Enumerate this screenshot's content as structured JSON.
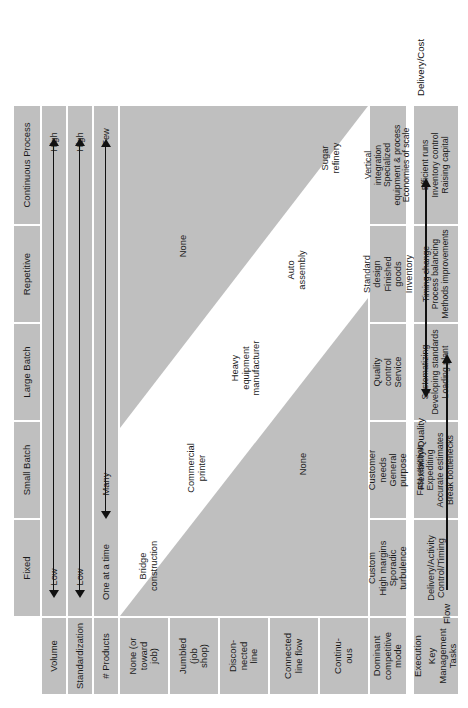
{
  "diagram": {
    "flow_axis_label": "Flow",
    "right_axis": {
      "top_label": "Delivery/Cost",
      "bottom_label": "Flexibility/Quality"
    },
    "corner_header": {
      "line1": "Execution",
      "line2": "Key",
      "line3": "Management",
      "line4": "Tasks"
    },
    "columns": [
      "Fixed",
      "Small Batch",
      "Large Batch",
      "Repetitive",
      "Continuous Process"
    ],
    "row_headers": [
      "Volume",
      "Standardization",
      "# Products"
    ],
    "scales": [
      {
        "name": "Volume",
        "low": "Low",
        "high": "High"
      },
      {
        "name": "Standardization",
        "low": "Low",
        "high": "High"
      },
      {
        "name": "# Products",
        "low": "One at a time",
        "high": "Few",
        "mid": "Many"
      }
    ],
    "process_rows": [
      "None (or\ntoward\njob)",
      "Jumbled\n(job\nshop)",
      "Discon-\nnected\nline",
      "Connected\nline flow",
      "Continu-\nous"
    ],
    "process_rows_flat": [
      "None (or toward job)",
      "Jumbled (job shop)",
      "Disconnected line",
      "Connected line flow",
      "Continuous"
    ],
    "examples": [
      {
        "label": "Bridge\nconstruction",
        "row": 0,
        "col": 0
      },
      {
        "label": "Commercial\nprinter",
        "row": 1,
        "col": 1
      },
      {
        "label": "Heavy\nequipment\nmanufacturer",
        "row": 2,
        "col": 2
      },
      {
        "label": "Auto\nassembly",
        "row": 3,
        "col": 3
      },
      {
        "label": "Sugar\nrefinery",
        "row": 4,
        "col": 4
      }
    ],
    "none_upper": "None",
    "none_lower": "None",
    "bottom_row_header": "Dominant\ncompetitive\nmode",
    "dominant_competitive_mode": [
      "Custom\nHigh margins\nSporadic\nturbulence",
      "Customer\nneeds\nGeneral\npurpose",
      "Quality\ncontrol\nService",
      "Standard\ndesign\nFinished\ngoods\nInventory",
      "Vertical\nintegration\nSpecialized\nequipment & process\nEconomies of scale"
    ],
    "key_management_tasks": [
      "Delivery/Activity\nControl/Timing",
      "Fast reaction\nExpediting\nAccurate estimates\nBreak bottlenecks",
      "Systematizing\nDeveloping standards\nLoading plant",
      "Timing change\nProcess balancing\nMethods improvements",
      "Efficient runs\nInventory control\nRaising capital"
    ]
  },
  "colors": {
    "cell_fill": "#bfbfbf",
    "band_fill": "#ffffff",
    "none_fill": "#bfbfbf",
    "text": "#1a1a1a",
    "arrow": "#111111",
    "page": "#ffffff"
  }
}
